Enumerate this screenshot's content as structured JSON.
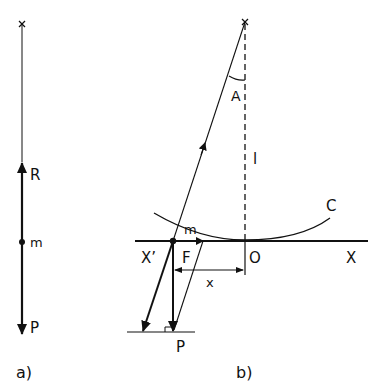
{
  "panel_a": {
    "caption": "a)",
    "labels": {
      "R": "R",
      "m": "m",
      "P": "P"
    }
  },
  "panel_b": {
    "caption": "b)",
    "labels": {
      "A": "A",
      "l": "l",
      "C": "C",
      "m": "m",
      "F": "F",
      "X_prime": "X’",
      "O": "O",
      "X": "X",
      "x": "x",
      "P": "P"
    }
  },
  "colors": {
    "ink": "#111111",
    "background": "#ffffff"
  }
}
